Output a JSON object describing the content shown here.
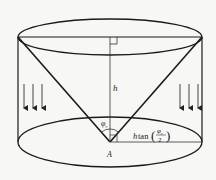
{
  "diagram": {
    "type": "cylinder-with-inverted-cone",
    "colors": {
      "background": "#f7f7f5",
      "stroke": "#1a1a1a",
      "thin_stroke": "#333333",
      "arrow": "#444444"
    },
    "labels": {
      "height": "h",
      "angle": "φ",
      "angle_sub": "r",
      "apex": "A",
      "radius_prefix": "h",
      "radius_func": "tan",
      "radius_frac_num": "φ",
      "radius_frac_num_sub": "r",
      "radius_frac_den": "2"
    },
    "right_angle_marker_top": true,
    "right_angle_marker_bottom": true,
    "arrows": {
      "left_count": 3,
      "right_count": 3,
      "direction": "down"
    }
  }
}
